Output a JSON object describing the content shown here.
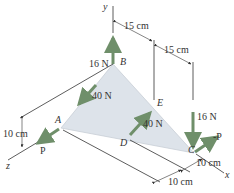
{
  "diagram": {
    "type": "3d-statics-triangle-plate",
    "colors": {
      "force_arrow": "#6f8f6a",
      "plate_fill": "#dde3ea",
      "line": "#333333",
      "text": "#333333"
    },
    "axes": {
      "x": "x",
      "y": "y",
      "z": "z"
    },
    "points": {
      "A": "A",
      "B": "B",
      "C": "C",
      "D": "D",
      "E": "E"
    },
    "forces": {
      "B_up": "16 N",
      "BA_along": "40 N",
      "DE_along": "40 N",
      "C_down": "16 N",
      "A_P": "P",
      "C_negP": "-P"
    },
    "dimensions": {
      "top_1": "15 cm",
      "top_2": "15 cm",
      "left_height": "10 cm",
      "bottom_1": "10 cm",
      "bottom_2": "10 cm"
    }
  }
}
